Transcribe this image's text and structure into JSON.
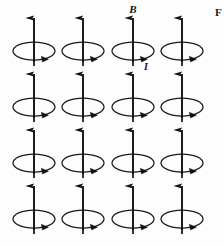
{
  "figure": {
    "background_color": "#fdfdfd",
    "ink_color": "#111111",
    "loop_stroke_color": "#1a1a1a",
    "axis_hidden_color": "#9a9a9a",
    "grid": {
      "rows": 4,
      "columns": 4,
      "column_centers_x": [
        34,
        83,
        133,
        182
      ],
      "row_centers_y": [
        51,
        107,
        163,
        219
      ],
      "loop_radius_x": 21,
      "loop_radius_y": 9,
      "arrow_top_y_offset": -33,
      "arrow_bottom_y_offset": 15
    },
    "labels": {
      "field_label": "B",
      "field_label_x": 133,
      "field_label_y": 13,
      "current_label": "I",
      "current_label_x": 146,
      "current_label_y": 70,
      "edge_partial_label": "F",
      "edge_partial_label_x": 215,
      "edge_partial_label_y": 16
    },
    "elements": {
      "dipole_name": "current-loop-dipole",
      "field_arrow_name": "magnetic-field-arrow",
      "loop_name": "current-loop-ellipse",
      "current_arrow_name": "current-direction-arrowhead"
    }
  }
}
